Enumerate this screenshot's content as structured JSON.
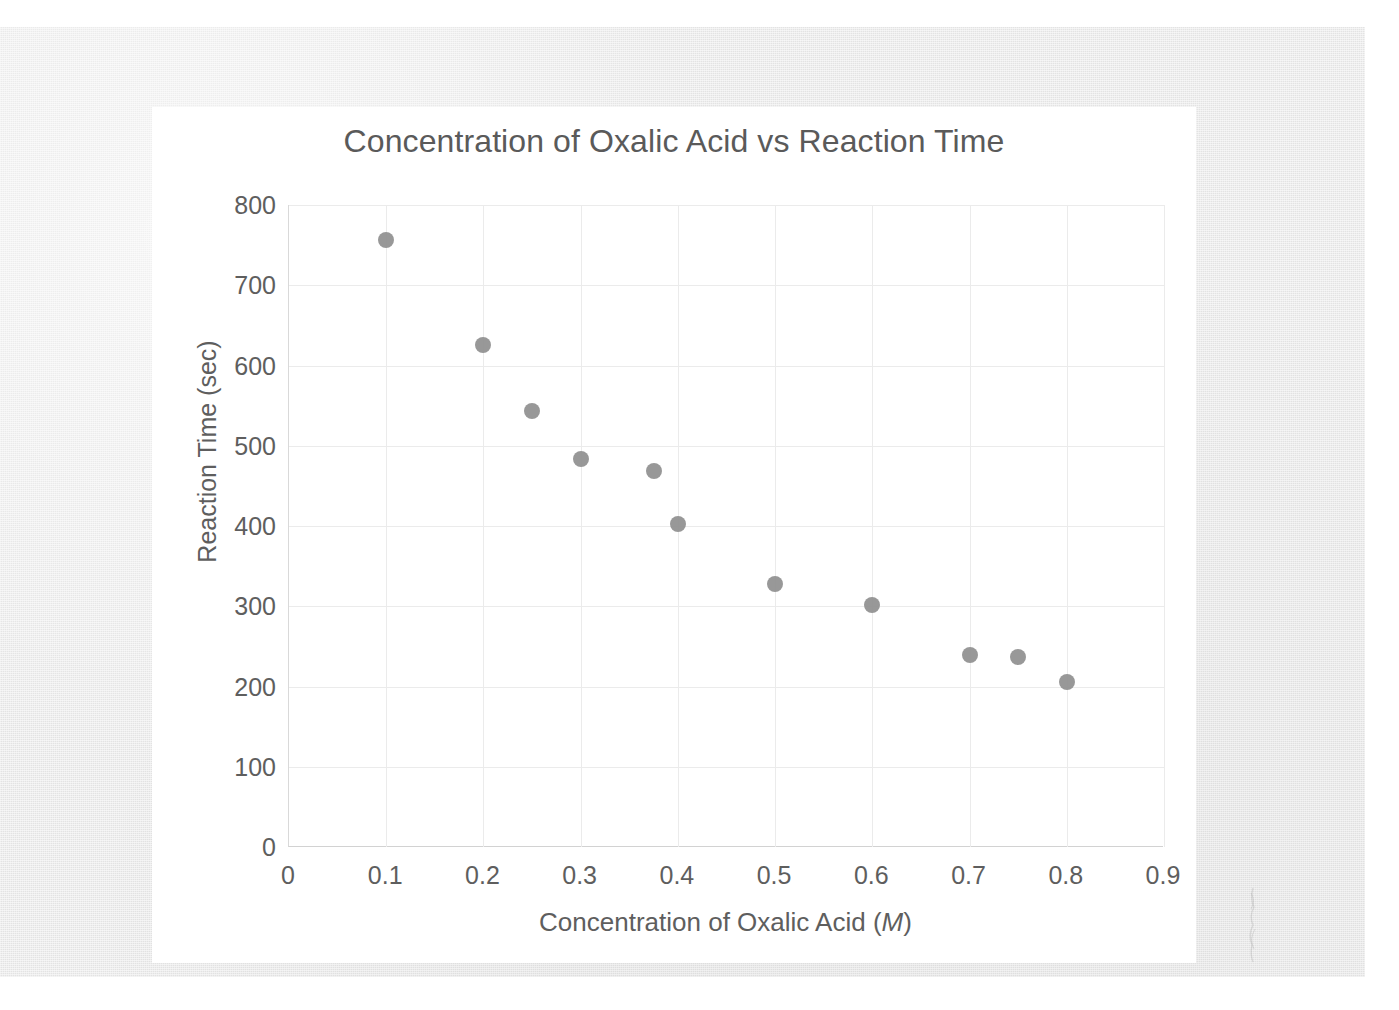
{
  "chart_data": {
    "type": "scatter",
    "title": "Concentration of Oxalic Acid vs Reaction Time",
    "xlabel": "Concentration of Oxalic Acid (M)",
    "xlabel_italic_part": "M",
    "ylabel": "Reaction Time (sec)",
    "xlim": [
      0,
      0.9
    ],
    "ylim": [
      0,
      800
    ],
    "xticks": [
      "0",
      "0.1",
      "0.2",
      "0.3",
      "0.4",
      "0.5",
      "0.6",
      "0.7",
      "0.8",
      "0.9"
    ],
    "xtick_values": [
      0,
      0.1,
      0.2,
      0.3,
      0.4,
      0.5,
      0.6,
      0.7,
      0.8,
      0.9
    ],
    "yticks": [
      "0",
      "100",
      "200",
      "300",
      "400",
      "500",
      "600",
      "700",
      "800"
    ],
    "ytick_values": [
      0,
      100,
      200,
      300,
      400,
      500,
      600,
      700,
      800
    ],
    "grid": true,
    "legend": false,
    "marker_color": "#8f8f8f",
    "marker_shape": "circle",
    "series": [
      {
        "name": "Reaction Time",
        "points": [
          {
            "x": 0.1,
            "y": 757
          },
          {
            "x": 0.2,
            "y": 625
          },
          {
            "x": 0.25,
            "y": 543
          },
          {
            "x": 0.3,
            "y": 484
          },
          {
            "x": 0.375,
            "y": 469
          },
          {
            "x": 0.4,
            "y": 403
          },
          {
            "x": 0.5,
            "y": 328
          },
          {
            "x": 0.6,
            "y": 301
          },
          {
            "x": 0.7,
            "y": 239
          },
          {
            "x": 0.75,
            "y": 237
          },
          {
            "x": 0.8,
            "y": 206
          }
        ]
      }
    ]
  },
  "colors": {
    "marker": "#8f8f8f",
    "grid": "#ebebeb",
    "axis": "#d9d9d9",
    "text": "#5e5e5e",
    "title_text": "#5a5a5a",
    "card_background": "#ffffff",
    "page_background": "#e9e9e9"
  }
}
